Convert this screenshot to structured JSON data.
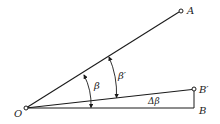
{
  "diagram": {
    "type": "angle-geometry",
    "points": {
      "O": {
        "label": "O",
        "x": 26,
        "y": 108
      },
      "A": {
        "label": "A",
        "x": 181,
        "y": 11
      },
      "B_prime": {
        "label": "B′",
        "x": 194,
        "y": 89
      },
      "B": {
        "label": "B",
        "x": 194,
        "y": 108
      }
    },
    "angles": {
      "beta": {
        "label": "β"
      },
      "beta_prime": {
        "label": "β′"
      },
      "delta_beta": {
        "label": "Δβ"
      }
    },
    "colors": {
      "stroke": "#1a1a1a",
      "text": "#222222",
      "background": "#ffffff"
    }
  }
}
